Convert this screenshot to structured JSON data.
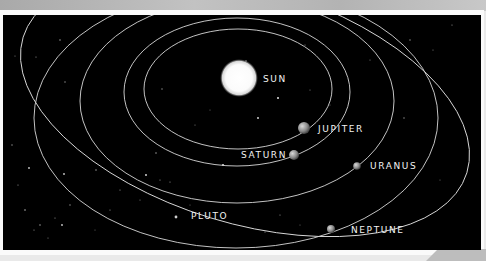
{
  "diagram": {
    "bodies": [
      {
        "name": "sun",
        "label": "SUN"
      },
      {
        "name": "jupiter",
        "label": "JUPITER"
      },
      {
        "name": "saturn",
        "label": "SATURN"
      },
      {
        "name": "uranus",
        "label": "URANUS"
      },
      {
        "name": "neptune",
        "label": "NEPTUNE"
      },
      {
        "name": "pluto",
        "label": "PLUTO"
      }
    ],
    "colors": {
      "space": "#000000",
      "orbit": "#d8d8d8",
      "label": "#f2f2f2",
      "frame": "#fafafa"
    }
  }
}
